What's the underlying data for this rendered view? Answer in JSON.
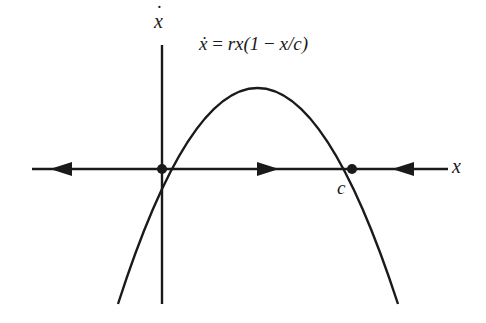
{
  "diagram": {
    "type": "phase-line",
    "equation_label": "ẋ = rx(1 − x/c)",
    "equation_parts": {
      "lhs": "ẋ",
      "eq": " = ",
      "rhs_a": "rx(1 ",
      "minus": "−",
      "rhs_b": " x/c)"
    },
    "vertical_axis_label": "x",
    "horizontal_axis_label": "x",
    "fixed_point_label": "c",
    "fixed_points": [
      {
        "name": "origin",
        "x": 0,
        "stability": "unstable"
      },
      {
        "name": "c",
        "x": "c",
        "stability": "stable"
      }
    ],
    "flow_arrows": [
      {
        "region": "x<0",
        "direction": "left"
      },
      {
        "region": "0<x<c",
        "direction": "right"
      },
      {
        "region": "x>c",
        "direction": "left"
      }
    ],
    "colors": {
      "ink": "#1a1a1a",
      "background": "#ffffff"
    }
  }
}
